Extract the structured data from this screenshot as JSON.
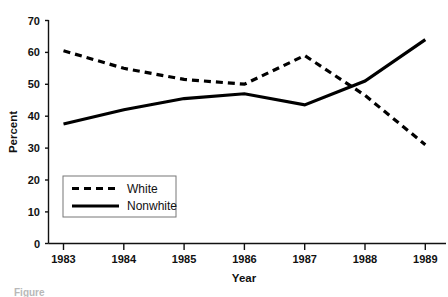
{
  "chart_data": {
    "type": "line",
    "title": "",
    "xlabel": "Year",
    "ylabel": "Percent",
    "categories": [
      "1983",
      "1984",
      "1985",
      "1986",
      "1987",
      "1988",
      "1989"
    ],
    "x": [
      1983,
      1984,
      1985,
      1986,
      1987,
      1988,
      1989
    ],
    "xlim": [
      1983,
      1989
    ],
    "ylim": [
      0,
      70
    ],
    "yticks": [
      0,
      10,
      20,
      30,
      40,
      50,
      60,
      70
    ],
    "ytick_labels": [
      "0",
      "10",
      "20",
      "30",
      "40",
      "50",
      "60",
      "70"
    ],
    "grid": false,
    "legend_position": "lower-left-inside",
    "series": [
      {
        "name": "White",
        "style": "dashed",
        "color": "#000000",
        "values": [
          60.5,
          55.0,
          51.5,
          50.0,
          59.0,
          46.5,
          31.0
        ]
      },
      {
        "name": "Nonwhite",
        "style": "solid",
        "color": "#000000",
        "values": [
          37.5,
          42.0,
          45.5,
          47.0,
          43.5,
          51.0,
          64.0
        ]
      }
    ]
  },
  "axes": {
    "y_title": "Percent",
    "x_title": "Year",
    "y_tick_labels": [
      "70",
      "60",
      "50",
      "40",
      "30",
      "20",
      "10",
      "0"
    ],
    "x_tick_labels": [
      "1983",
      "1984",
      "1985",
      "1986",
      "1987",
      "1988",
      "1989"
    ]
  },
  "legend": {
    "entries": [
      {
        "label": "White",
        "style": "dashed"
      },
      {
        "label": "Nonwhite",
        "style": "solid"
      }
    ]
  },
  "caption": {
    "text": "Figure"
  }
}
